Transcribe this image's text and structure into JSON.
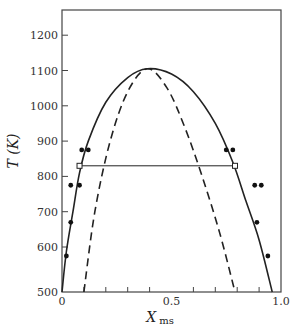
{
  "chart_data": {
    "type": "line",
    "title": "",
    "xlabel": "X",
    "xlabel_subscript": "ms",
    "ylabel": "T (K)",
    "xlim": [
      0,
      1.0
    ],
    "ylim": [
      500,
      1270
    ],
    "x_tick_labels": [
      "0",
      "0.5",
      "1.0"
    ],
    "x_ticks_minor": [
      0.1,
      0.2,
      0.3,
      0.4,
      0.6,
      0.7,
      0.8,
      0.9
    ],
    "y_tick_labels": [
      "500",
      "600",
      "700",
      "800",
      "900",
      "1000",
      "1100",
      "1200"
    ],
    "y_axis_break_note": "500 label placed at axis bottom (broken axis)",
    "grid": false,
    "legend": null,
    "series": [
      {
        "name": "binodal (coexistence curve)",
        "style": "solid",
        "x": [
          0.0,
          0.02,
          0.05,
          0.08,
          0.12,
          0.2,
          0.3,
          0.39,
          0.5,
          0.6,
          0.7,
          0.78,
          0.84,
          0.9,
          0.96
        ],
        "y": [
          500,
          590,
          700,
          810,
          900,
          1010,
          1080,
          1105,
          1090,
          1040,
          950,
          840,
          730,
          620,
          500
        ]
      },
      {
        "name": "spinodal",
        "style": "dashed",
        "x": [
          0.1,
          0.15,
          0.22,
          0.3,
          0.39,
          0.48,
          0.56,
          0.64,
          0.72,
          0.79
        ],
        "y": [
          500,
          700,
          900,
          1040,
          1105,
          1050,
          940,
          800,
          640,
          500
        ]
      },
      {
        "name": "tie line",
        "style": "solid",
        "x": [
          0.08,
          0.79
        ],
        "y": [
          830,
          830
        ]
      }
    ],
    "points_filled": [
      {
        "x": 0.02,
        "y": 580
      },
      {
        "x": 0.04,
        "y": 670
      },
      {
        "x": 0.04,
        "y": 775
      },
      {
        "x": 0.08,
        "y": 775
      },
      {
        "x": 0.09,
        "y": 875
      },
      {
        "x": 0.12,
        "y": 875
      },
      {
        "x": 0.75,
        "y": 875
      },
      {
        "x": 0.78,
        "y": 875
      },
      {
        "x": 0.88,
        "y": 775
      },
      {
        "x": 0.91,
        "y": 775
      },
      {
        "x": 0.89,
        "y": 670
      },
      {
        "x": 0.94,
        "y": 580
      }
    ],
    "points_open": [
      {
        "x": 0.08,
        "y": 830
      },
      {
        "x": 0.79,
        "y": 830
      }
    ]
  }
}
